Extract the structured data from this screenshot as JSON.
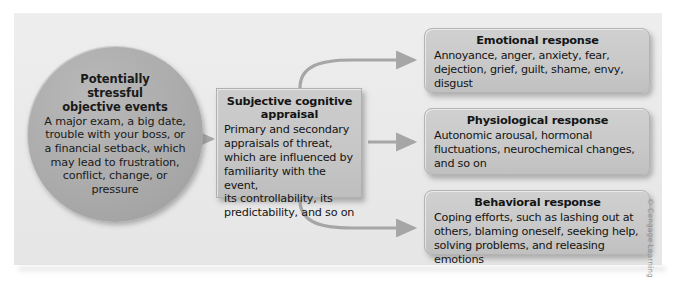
{
  "figure": {
    "name": "stress-appraisal-response-flowchart",
    "credit": "© Cengage Learning"
  },
  "nodes": {
    "stressor": {
      "title": "Potentially stressful objective events",
      "title_lines": [
        "Potentially",
        "stressful",
        "objective events"
      ],
      "body": "A major exam, a big date, trouble with your boss, or a financial setback, which may lead to frustration, conflict, change, or pressure",
      "body_lines": [
        "A major exam, a big date,",
        "trouble with your boss, or",
        "a financial setback, which",
        "may lead to frustration,",
        "conflict, change, or",
        "pressure"
      ]
    },
    "appraisal": {
      "title": "Subjective cognitive appraisal",
      "title_lines": [
        "Subjective cognitive",
        "appraisal"
      ],
      "body": "Primary and secondary appraisals of threat, which are influenced by familiarity with the event, its controllability, its predictability, and so on",
      "body_lines": [
        "Primary and secondary",
        "appraisals of threat,",
        "which are influenced by",
        "familiarity with the event,",
        "its controllability, its",
        "predictability, and so on"
      ]
    },
    "responses": [
      {
        "id": "emotional",
        "title": "Emotional response",
        "body": "Annoyance, anger, anxiety, fear, dejection, grief, guilt, shame, envy, disgust",
        "body_lines": [
          "Annoyance, anger, anxiety, fear,",
          "dejection, grief, guilt, shame, envy,",
          "disgust"
        ]
      },
      {
        "id": "physiological",
        "title": "Physiological response",
        "body": "Autonomic arousal, hormonal fluctuations, neurochemical changes, and so on",
        "body_lines": [
          "Autonomic arousal, hormonal",
          "fluctuations, neurochemical changes,",
          "and so on"
        ]
      },
      {
        "id": "behavioral",
        "title": "Behavioral response",
        "body": "Coping efforts, such as lashing out at others, blaming oneself, seeking help, solving problems, and releasing emotions",
        "body_lines": [
          "Coping efforts, such as lashing out at",
          "others, blaming oneself, seeking help,",
          "solving problems, and releasing emotions"
        ]
      }
    ]
  },
  "connectors": [
    {
      "id": "stressor-to-appraisal",
      "from": "stressor",
      "to": "appraisal",
      "style": "straight-arrow"
    },
    {
      "id": "appraisal-to-emotional",
      "from": "appraisal",
      "to": "emotional",
      "style": "curved-arrow-up"
    },
    {
      "id": "appraisal-to-physiological",
      "from": "appraisal",
      "to": "physiological",
      "style": "straight-arrow"
    },
    {
      "id": "appraisal-to-behavioral",
      "from": "appraisal",
      "to": "behavioral",
      "style": "curved-arrow-down"
    }
  ],
  "colors": {
    "panel_background": "#ebebeb",
    "circle_fill": "#ababab",
    "box_fill": "#c9c9c9",
    "arrow": "#a6a6a6",
    "text": "#141414",
    "credit_text": "#8e8e8e"
  }
}
